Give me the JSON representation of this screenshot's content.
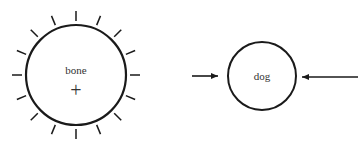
{
  "diagram": {
    "nodes": [
      {
        "id": "bone",
        "label": "bone",
        "cx": 76,
        "cy": 75,
        "r": 50,
        "ticks": 16,
        "center_mark": "+"
      },
      {
        "id": "dog",
        "label": "dog",
        "cx": 262,
        "cy": 76,
        "r": 34
      }
    ],
    "arrows": [
      {
        "from_x": 192,
        "to_x": 218,
        "y": 76,
        "direction": "right"
      },
      {
        "from_x": 358,
        "to_x": 302,
        "y": 77,
        "direction": "left"
      }
    ],
    "colors": {
      "stroke": "#1a1a1a",
      "text": "#333333",
      "background": "#ffffff"
    }
  }
}
